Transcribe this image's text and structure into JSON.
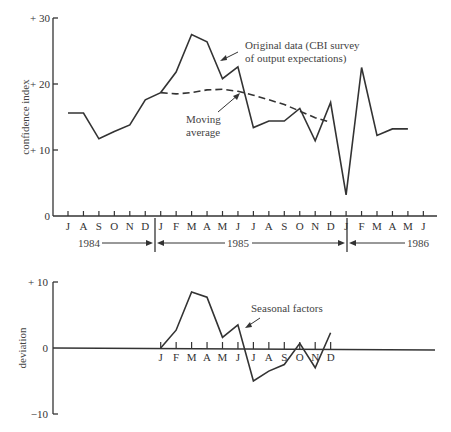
{
  "chart_data": [
    {
      "type": "line",
      "title": "",
      "ylabel": "confidence index",
      "xlabel": "",
      "ylim": [
        0,
        30
      ],
      "yticks": [
        "0",
        "+ 10",
        "+ 20",
        "+ 30"
      ],
      "categories": [
        "J",
        "A",
        "S",
        "O",
        "N",
        "D",
        "J",
        "F",
        "M",
        "A",
        "M",
        "J",
        "J",
        "A",
        "S",
        "O",
        "N",
        "D",
        "J",
        "F",
        "M",
        "A",
        "M",
        "J"
      ],
      "year_labels": [
        "1984",
        "1985",
        "1986"
      ],
      "series": [
        {
          "name": "Original data (CBI survey of output expectations)",
          "style": "solid",
          "values": [
            15.6,
            15.6,
            11.7,
            12.8,
            13.8,
            17.6,
            18.7,
            21.8,
            27.5,
            26.4,
            20.8,
            22.6,
            13.4,
            14.4,
            14.4,
            16.3,
            11.4,
            17.2,
            3.2,
            22.5,
            12.2,
            13.2,
            13.2,
            null
          ]
        },
        {
          "name": "Moving average",
          "style": "dashed",
          "values": [
            null,
            null,
            null,
            null,
            null,
            null,
            18.7,
            18.5,
            18.7,
            19.1,
            19.2,
            18.9,
            18.3,
            17.6,
            16.9,
            15.9,
            14.9,
            14.2,
            null,
            null,
            null,
            null,
            null,
            null
          ]
        }
      ],
      "annotations": [
        "Original data (CBI survey",
        "of output expectations)",
        "Moving",
        "average"
      ]
    },
    {
      "type": "line",
      "title": "",
      "ylabel": "deviation",
      "ylim": [
        -10,
        10
      ],
      "yticks": [
        "−10",
        "0",
        "+ 10"
      ],
      "categories": [
        "J",
        "F",
        "M",
        "A",
        "M",
        "J",
        "J",
        "A",
        "S",
        "O",
        "N",
        "D"
      ],
      "series": [
        {
          "name": "Seasonal factors",
          "values": [
            0,
            2.7,
            8.5,
            7.7,
            1.6,
            3.5,
            -5.0,
            -3.5,
            -2.5,
            0.7,
            -3.0,
            2.3
          ]
        }
      ],
      "annotations": [
        "Seasonal factors"
      ]
    }
  ],
  "top": {
    "ylabel": "confidence index",
    "yticks": {
      "t0": "0",
      "t10": "+ 10",
      "t20": "+ 20",
      "t30": "+ 30"
    },
    "ann1": "Original data (CBI survey",
    "ann2": "of output expectations)",
    "ann3": "Moving",
    "ann4": "average",
    "y1984": "1984",
    "y1985": "1985",
    "y1986": "1986"
  },
  "bottom": {
    "ylabel": "deviation",
    "yticks": {
      "tp10": "+ 10",
      "t0": "0",
      "tm10": "−10"
    },
    "ann": "Seasonal factors"
  }
}
